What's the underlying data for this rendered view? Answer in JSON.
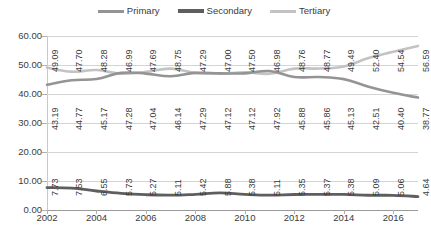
{
  "chart_data": {
    "type": "line",
    "title": "",
    "subtitle": "",
    "xlabel": "",
    "ylabel": "",
    "grid": true,
    "legend_position": "top-center",
    "ylim": [
      0,
      60
    ],
    "yticks": [
      "0.00",
      "10.00",
      "20.00",
      "30.00",
      "40.00",
      "50.00",
      "60.00"
    ],
    "ytick_values": [
      0,
      10,
      20,
      30,
      40,
      50,
      60
    ],
    "x": [
      2002,
      2003,
      2004,
      2005,
      2006,
      2007,
      2008,
      2009,
      2010,
      2011,
      2012,
      2013,
      2014,
      2015,
      2016,
      2017
    ],
    "xticks_shown": [
      "2002",
      "2004",
      "2006",
      "2008",
      "2010",
      "2012",
      "2014",
      "2016"
    ],
    "xtick_values": [
      2002,
      2004,
      2006,
      2008,
      2010,
      2012,
      2014,
      2016
    ],
    "series": [
      {
        "name": "Primary",
        "color": "#949494",
        "width": 2.6,
        "values": [
          43.19,
          44.77,
          45.17,
          47.28,
          47.04,
          46.14,
          47.29,
          47.12,
          47.12,
          47.92,
          45.88,
          45.86,
          45.13,
          42.51,
          40.4,
          38.77
        ],
        "labels": [
          "43.19",
          "44.77",
          "45.17",
          "47.28",
          "47.04",
          "46.14",
          "47.29",
          "47.12",
          "47.12",
          "47.92",
          "45.88",
          "45.86",
          "45.13",
          "42.51",
          "40.40",
          "38.77"
        ]
      },
      {
        "name": "Secondary",
        "color": "#5e5e5e",
        "width": 2.8,
        "values": [
          7.73,
          7.53,
          6.55,
          5.73,
          5.27,
          5.11,
          5.42,
          5.88,
          5.38,
          5.11,
          5.35,
          5.37,
          5.38,
          5.09,
          5.06,
          4.64
        ],
        "labels": [
          "7.73",
          "7.53",
          "6.55",
          "5.73",
          "5.27",
          "5.11",
          "5.42",
          "5.88",
          "5.38",
          "5.11",
          "5.35",
          "5.37",
          "5.38",
          "5.09",
          "5.06",
          "4.64"
        ]
      },
      {
        "name": "Tertiary",
        "color": "#c3c3c3",
        "width": 2.6,
        "values": [
          49.09,
          47.7,
          48.28,
          46.99,
          47.69,
          48.75,
          47.29,
          47.0,
          47.5,
          46.98,
          48.76,
          48.77,
          49.49,
          52.4,
          54.54,
          56.59
        ],
        "labels": [
          "49.09",
          "47.70",
          "48.28",
          "46.99",
          "47.69",
          "48.75",
          "47.29",
          "47.00",
          "47.50",
          "46.98",
          "48.76",
          "48.77",
          "49.49",
          "52.40",
          "54.54",
          "56.59"
        ]
      }
    ]
  },
  "legend": {
    "items": [
      {
        "label": "Primary",
        "color": "#949494",
        "thickness": 3
      },
      {
        "label": "Secondary",
        "color": "#5e5e5e",
        "thickness": 4
      },
      {
        "label": "Tertiary",
        "color": "#c3c3c3",
        "thickness": 3
      }
    ]
  }
}
